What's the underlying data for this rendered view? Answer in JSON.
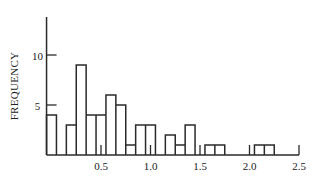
{
  "chart_data": {
    "type": "bar",
    "title": "",
    "xlabel": "",
    "ylabel": "FREQUENCY",
    "xlim": [
      -0.05,
      2.5
    ],
    "ylim": [
      0,
      14
    ],
    "grid": false,
    "legend": null,
    "histogram": true,
    "bin_width": 0.1,
    "bins": [
      {
        "x0": -0.05,
        "x1": 0.05,
        "count": 4
      },
      {
        "x0": 0.05,
        "x1": 0.15,
        "count": 0
      },
      {
        "x0": 0.15,
        "x1": 0.25,
        "count": 3
      },
      {
        "x0": 0.25,
        "x1": 0.35,
        "count": 9
      },
      {
        "x0": 0.35,
        "x1": 0.45,
        "count": 4
      },
      {
        "x0": 0.45,
        "x1": 0.55,
        "count": 4
      },
      {
        "x0": 0.55,
        "x1": 0.65,
        "count": 6
      },
      {
        "x0": 0.65,
        "x1": 0.75,
        "count": 5
      },
      {
        "x0": 0.75,
        "x1": 0.85,
        "count": 1
      },
      {
        "x0": 0.85,
        "x1": 0.95,
        "count": 3
      },
      {
        "x0": 0.95,
        "x1": 1.05,
        "count": 3
      },
      {
        "x0": 1.05,
        "x1": 1.15,
        "count": 0
      },
      {
        "x0": 1.15,
        "x1": 1.25,
        "count": 2
      },
      {
        "x0": 1.25,
        "x1": 1.35,
        "count": 1
      },
      {
        "x0": 1.35,
        "x1": 1.45,
        "count": 3
      },
      {
        "x0": 1.45,
        "x1": 1.55,
        "count": 0
      },
      {
        "x0": 1.55,
        "x1": 1.65,
        "count": 1
      },
      {
        "x0": 1.65,
        "x1": 1.75,
        "count": 1
      },
      {
        "x0": 1.75,
        "x1": 2.05,
        "count": 0
      },
      {
        "x0": 2.05,
        "x1": 2.15,
        "count": 1
      },
      {
        "x0": 2.15,
        "x1": 2.25,
        "count": 1
      }
    ],
    "categories": [
      "0.0",
      "0.1",
      "0.2",
      "0.3",
      "0.4",
      "0.5",
      "0.6",
      "0.7",
      "0.8",
      "0.9",
      "1.0",
      "1.1",
      "1.2",
      "1.3",
      "1.4",
      "1.5",
      "1.6",
      "1.7",
      "1.8",
      "1.9",
      "2.0",
      "2.1",
      "2.2"
    ],
    "values": [
      4,
      0,
      3,
      9,
      4,
      4,
      6,
      5,
      1,
      3,
      3,
      0,
      2,
      1,
      3,
      0,
      1,
      1,
      0,
      0,
      0,
      1,
      1
    ],
    "x_ticks": [
      0.5,
      1.0,
      1.5,
      2.0,
      2.5
    ],
    "x_tick_labels": [
      "0.5",
      "1.0",
      "1.5",
      "2.0",
      "2.5"
    ],
    "y_ticks": [
      5,
      10
    ],
    "y_tick_labels": [
      "5",
      "10"
    ]
  },
  "colors": {
    "line": "#2a2a2a",
    "background": "#ffffff"
  }
}
